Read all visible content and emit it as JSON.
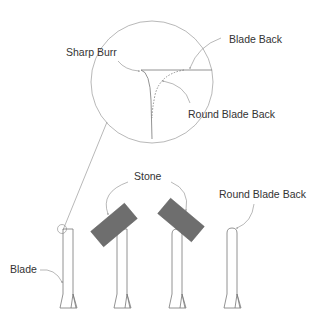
{
  "labels": {
    "sharp_burr": "Sharp Burr",
    "blade_back": "Blade Back",
    "round_blade_back_detail": "Round Blade Back",
    "stone": "Stone",
    "round_blade_back": "Round Blade Back",
    "blade": "Blade"
  },
  "colors": {
    "line": "#777777",
    "stone": "#6e6e6e",
    "text": "#333333",
    "background": "#ffffff"
  }
}
